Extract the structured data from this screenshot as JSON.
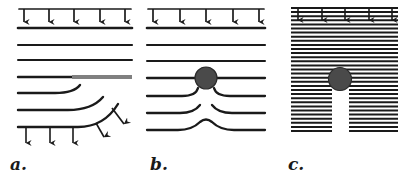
{
  "figure": {
    "background_color": "#ffffff",
    "ink_color": "#1a1a1a",
    "gray_color": "#808080",
    "blob_color": "#4a4a4a",
    "width": 413,
    "height": 175
  },
  "panels": [
    {
      "id": "a",
      "label": "a.",
      "description": "Uniform downward load on a surface; parallel material layers below; a gray reinforcing segment on the right half of the fourth layer; lower layers deflect upward toward the right; bottom boundary carries downward reaction arrows and inclined arrows along the curved rise.",
      "top_load": {
        "arrow_count": 5,
        "direction": "down",
        "label": "distributed-load"
      },
      "bottom_load": {
        "arrow_count": 3,
        "direction": "down",
        "label": "reaction-load"
      },
      "inclined_arrows": {
        "arrow_count": 2,
        "direction": "down-right",
        "label": "deflected-load"
      },
      "layer_count": 7,
      "gray_segment": {
        "present": true,
        "on_layer": 4,
        "side": "right",
        "color": "#808080"
      },
      "inclusion": {
        "present": false
      }
    },
    {
      "id": "b",
      "label": "b.",
      "description": "Uniform downward load on a surface; parallel material layers below; a dark circular rigid inclusion embedded on the fourth layer; layers below the inclusion bulge upward and separate around it.",
      "top_load": {
        "arrow_count": 5,
        "direction": "down",
        "label": "distributed-load"
      },
      "bottom_load": {
        "arrow_count": 0,
        "direction": "none",
        "label": "none"
      },
      "inclined_arrows": {
        "arrow_count": 0,
        "direction": "none",
        "label": "none"
      },
      "layer_count": 7,
      "gray_segment": {
        "present": false
      },
      "inclusion": {
        "present": true,
        "shape": "circle",
        "color": "#4a4a4a",
        "radius_px": 11,
        "label": "rigid-inclusion"
      }
    },
    {
      "id": "c",
      "label": "c.",
      "description": "Dense horizontal hatching representing closely packed layers under uniform downward load; a dark circular inclusion sits within the hatching with a clear vertical void channel extending below it.",
      "top_load": {
        "arrow_count": 5,
        "direction": "down",
        "label": "distributed-load"
      },
      "bottom_load": {
        "arrow_count": 0,
        "direction": "none",
        "label": "none"
      },
      "inclined_arrows": {
        "arrow_count": 0,
        "direction": "none",
        "label": "none"
      },
      "layer_count": 30,
      "hatch": {
        "line_count": 30,
        "spacing_px": 4.1,
        "label": "dense-hatching"
      },
      "gray_segment": {
        "present": false
      },
      "inclusion": {
        "present": true,
        "shape": "circle",
        "color": "#4a4a4a",
        "radius_px": 11,
        "label": "rigid-inclusion"
      },
      "void_channel": {
        "present": true,
        "orientation": "vertical",
        "position": "below-inclusion",
        "label": "void-channel"
      }
    }
  ]
}
